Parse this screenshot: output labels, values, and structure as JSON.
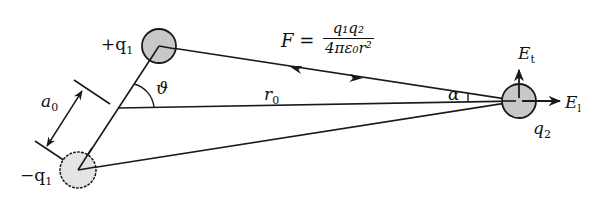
{
  "diagram": {
    "type": "electric dipole and test charge geometry",
    "charges": {
      "positive": {
        "label": "+q",
        "subscript": "1",
        "fill": "#c8c8c8",
        "style": "solid"
      },
      "negative": {
        "label": "−q",
        "subscript": "1",
        "fill": "#e4e4e4",
        "style": "dotted"
      },
      "test": {
        "label": "q",
        "subscript": "2",
        "fill": "#c8c8c8",
        "style": "solid"
      }
    },
    "labels": {
      "separation": {
        "base": "a",
        "sub": "0"
      },
      "distance": {
        "base": "r",
        "sub": "0"
      },
      "theta": "ϑ",
      "alpha": "α",
      "field_transverse": {
        "base": "E",
        "sub": "t"
      },
      "field_longitudinal": {
        "base": "E",
        "sub": "l"
      }
    },
    "formula": {
      "lhs": "F =",
      "numerator": "q₁q₂",
      "denominator": "4πε₀r²"
    },
    "colors": {
      "stroke": "#1a1a1a",
      "charge_fill": "#c8c8c8",
      "ghost_fill": "#e4e4e4"
    }
  }
}
